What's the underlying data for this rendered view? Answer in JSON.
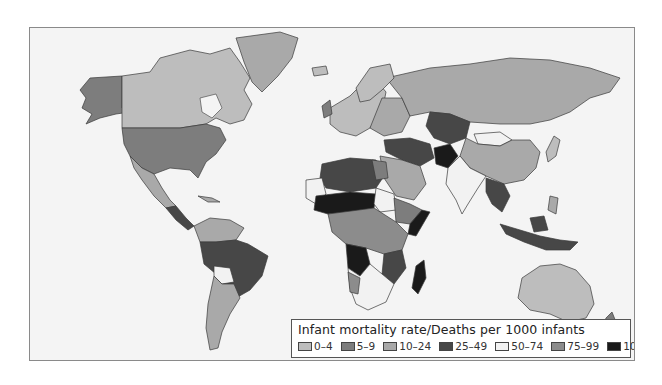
{
  "map": {
    "title": "Infant mortality rate/Deaths per 1000 infants",
    "type": "choropleth world map",
    "background": "#f4f4f4",
    "border_color": "#8a8a8a"
  },
  "legend": {
    "title": "Infant mortality rate/Deaths per 1000 infants",
    "items": [
      {
        "label": "0–4",
        "color": "#bdbdbd"
      },
      {
        "label": "5–9",
        "color": "#7d7d7d"
      },
      {
        "label": "10–24",
        "color": "#a9a9a9"
      },
      {
        "label": "25–49",
        "color": "#474747"
      },
      {
        "label": "50–74",
        "color": "#f2f2f2"
      },
      {
        "label": "75–99",
        "color": "#8c8c8c"
      },
      {
        "label": "100+",
        "color": "#1a1a1a"
      }
    ]
  },
  "regions": [
    {
      "name": "Alaska (USA)",
      "class": "5–9"
    },
    {
      "name": "Canada",
      "class": "0–4"
    },
    {
      "name": "Greenland",
      "class": "10–24"
    },
    {
      "name": "USA",
      "class": "5–9"
    },
    {
      "name": "Mexico",
      "class": "10–24"
    },
    {
      "name": "Central America",
      "class": "25–49"
    },
    {
      "name": "Northern South America",
      "class": "10–24"
    },
    {
      "name": "Brazil",
      "class": "25–49"
    },
    {
      "name": "Bolivia",
      "class": "50–74"
    },
    {
      "name": "Argentina/Chile",
      "class": "10–24"
    },
    {
      "name": "Western Europe",
      "class": "0–4"
    },
    {
      "name": "Eastern Europe",
      "class": "10–24"
    },
    {
      "name": "Russia",
      "class": "10–24"
    },
    {
      "name": "Kazakhstan/Central Asia",
      "class": "25–49"
    },
    {
      "name": "Mongolia",
      "class": "50–74"
    },
    {
      "name": "China",
      "class": "10–24"
    },
    {
      "name": "Afghanistan",
      "class": "100+"
    },
    {
      "name": "India",
      "class": "50–74"
    },
    {
      "name": "Southeast Asia",
      "class": "25–49"
    },
    {
      "name": "Indonesia",
      "class": "25–49"
    },
    {
      "name": "Australia",
      "class": "0–4"
    },
    {
      "name": "New Zealand",
      "class": "5–9"
    },
    {
      "name": "North Africa",
      "class": "25–49"
    },
    {
      "name": "Sahel",
      "class": "100+"
    },
    {
      "name": "Central Africa",
      "class": "75–99"
    },
    {
      "name": "Angola",
      "class": "100+"
    },
    {
      "name": "Southern Africa",
      "class": "50–74"
    },
    {
      "name": "Madagascar",
      "class": "100+"
    },
    {
      "name": "Middle East",
      "class": "10–24"
    },
    {
      "name": "Japan",
      "class": "0–4"
    }
  ]
}
